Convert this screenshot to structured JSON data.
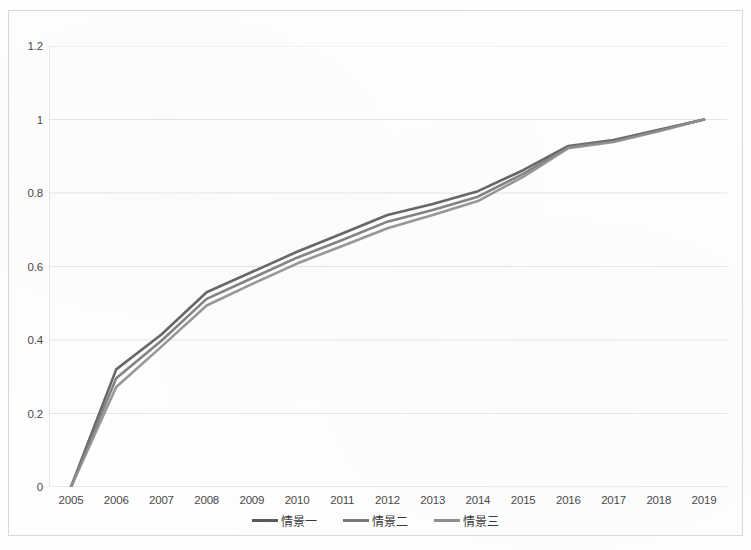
{
  "chart_data": {
    "type": "line",
    "title": "",
    "subtitle": "",
    "xlabel": "",
    "ylabel": "",
    "x": [
      2005,
      2006,
      2007,
      2008,
      2009,
      2010,
      2011,
      2012,
      2013,
      2014,
      2015,
      2016,
      2017,
      2018,
      2019
    ],
    "categories": [
      "2005",
      "2006",
      "2007",
      "2008",
      "2009",
      "2010",
      "2011",
      "2012",
      "2013",
      "2014",
      "2015",
      "2016",
      "2017",
      "2018",
      "2019"
    ],
    "xtick_labels": [
      "2005",
      "2006",
      "2007",
      "2008",
      "2009",
      "2010",
      "2011",
      "2012",
      "2013",
      "2014",
      "2015",
      "2016",
      "2017",
      "2018",
      "2019"
    ],
    "ytick_labels": [
      "0",
      "0.2",
      "0.4",
      "0.6",
      "0.8",
      "1",
      "1.2"
    ],
    "yticks": [
      0,
      0.2,
      0.4,
      0.6,
      0.8,
      1,
      1.2
    ],
    "ylim": [
      0,
      1.2
    ],
    "xlim": [
      2005,
      2019
    ],
    "grid": "horizontal",
    "legend_position": "bottom",
    "series": [
      {
        "name": "情景一",
        "color": "#5a5a5a",
        "values": [
          0.0,
          0.32,
          0.415,
          0.53,
          0.585,
          0.64,
          0.69,
          0.74,
          0.77,
          0.805,
          0.862,
          0.928,
          0.944,
          0.972,
          1.0
        ]
      },
      {
        "name": "情景二",
        "color": "#787878",
        "values": [
          0.0,
          0.296,
          0.398,
          0.512,
          0.568,
          0.624,
          0.672,
          0.722,
          0.754,
          0.79,
          0.852,
          0.925,
          0.941,
          0.97,
          1.0
        ]
      },
      {
        "name": "情景三",
        "color": "#8e8e8e",
        "values": [
          0.0,
          0.272,
          0.382,
          0.494,
          0.552,
          0.608,
          0.656,
          0.704,
          0.74,
          0.778,
          0.844,
          0.922,
          0.939,
          0.968,
          1.0
        ]
      }
    ]
  },
  "legend": {
    "items": [
      {
        "label": "情景一",
        "color": "#5a5a5a"
      },
      {
        "label": "情景二",
        "color": "#787878"
      },
      {
        "label": "情景三",
        "color": "#8e8e8e"
      }
    ]
  },
  "axes": {
    "gridline_color": "#e2e2e2",
    "axis_color": "#d5d5d5",
    "tick_text_color": "#4a4a4a"
  },
  "frame": {
    "border_color": "#d8d8d8",
    "background": "#fefefe"
  }
}
